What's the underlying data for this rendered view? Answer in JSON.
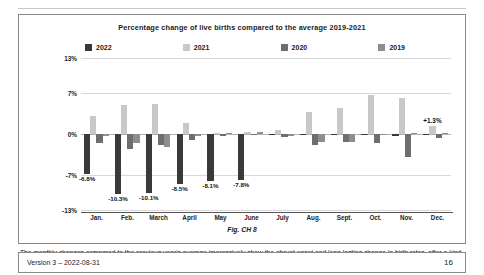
{
  "chart_data": {
    "type": "bar",
    "title": "Percentage change of live births compared to the average 2019-2021",
    "xlabel": "",
    "ylabel": "",
    "ylim": [
      -13,
      13
    ],
    "yticks": [
      "13%",
      "7%",
      "0%",
      "-7%",
      "-13%"
    ],
    "ytick_values": [
      13,
      7,
      0,
      -7,
      -13
    ],
    "grid": true,
    "legend_position": "top",
    "categories": [
      "Jan.",
      "Feb.",
      "March",
      "April",
      "May",
      "June",
      "July",
      "Aug.",
      "Sept.",
      "Oct.",
      "Nov.",
      "Dec."
    ],
    "series": [
      {
        "name": "2022",
        "color": "#3a3a3a",
        "values": [
          -6.8,
          -10.3,
          -10.1,
          -8.5,
          -8.1,
          -7.8,
          -0.2,
          -0.2,
          -0.2,
          -0.2,
          -0.3,
          -0.2
        ]
      },
      {
        "name": "2021",
        "color": "#c8c8c8",
        "values": [
          3.1,
          5.0,
          5.2,
          1.8,
          0.2,
          0.3,
          0.7,
          3.8,
          4.4,
          6.6,
          6.1,
          1.3
        ]
      },
      {
        "name": "2020",
        "color": "#6e6e6e",
        "values": [
          -1.5,
          -2.6,
          -1.9,
          -1.1,
          -0.3,
          -0.2,
          -0.5,
          -1.9,
          -1.3,
          -1.5,
          -4.0,
          -0.7
        ]
      },
      {
        "name": "2019",
        "color": "#8e8e8e",
        "values": [
          -0.3,
          -1.5,
          -2.3,
          -0.4,
          0.0,
          0.3,
          -0.4,
          -1.4,
          -1.4,
          -0.2,
          0.1,
          0.0
        ]
      }
    ],
    "data_labels": [
      {
        "category": "Jan.",
        "series": "2022",
        "text": "-6.8%"
      },
      {
        "category": "Feb.",
        "series": "2022",
        "text": "-10.3%"
      },
      {
        "category": "March",
        "series": "2022",
        "text": "-10.1%"
      },
      {
        "category": "April",
        "series": "2022",
        "text": "-8.5%"
      },
      {
        "category": "May",
        "series": "2022",
        "text": "-8.1%"
      },
      {
        "category": "June",
        "series": "2022",
        "text": "-7.8%"
      },
      {
        "category": "Dec.",
        "series": "2021",
        "text": "+1.3%"
      }
    ]
  },
  "figure": {
    "caption": "Fig. CH 8"
  },
  "body": {
    "paragraph": "The monthly changes compared to the previous year's average impressively show the abrupt onset and long-lasting change in birth rates, after a kind of mild \"catch-up effect\" had been evident before (green columns)."
  },
  "footer": {
    "version": "Version 3 – 2022-08-31",
    "page_number": "16"
  }
}
